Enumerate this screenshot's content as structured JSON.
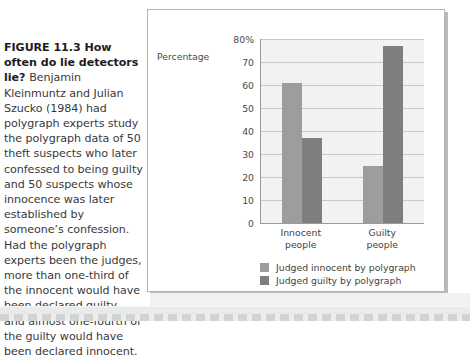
{
  "figure": {
    "caption_lead": "FIGURE 11.3 How often do lie detectors lie? ",
    "caption_body": "Benjamin Kleinmuntz and Julian Szucko (1984) had polygraph experts study the polygraph data of 50 theft suspects who later confessed to being guilty and 50 suspects whose innocence was later established by someone’s confession. Had the polygraph experts been the judges, more than one-third of the innocent would have been declared guilty, and almost one-fourth of the guilty would have been declared innocent."
  },
  "colors": {
    "series_light": "#9d9d9d",
    "series_dark": "#7e7e80",
    "plot_background": "#f2f2f2",
    "gridline": "#c9c9c9",
    "axis": "#9a9a9a",
    "text": "#3f3f41",
    "card_border": "#b2b5b7"
  },
  "chart_data": {
    "type": "bar",
    "title": "",
    "xlabel": "",
    "ylabel": "Percentage",
    "ylim": [
      0,
      80
    ],
    "yticks": [
      "80%",
      "70",
      "60",
      "50",
      "40",
      "30",
      "20",
      "10",
      "0"
    ],
    "ytick_values": [
      80,
      70,
      60,
      50,
      40,
      30,
      20,
      10,
      0
    ],
    "grid": true,
    "legend_position": "below-left",
    "categories": [
      "Innocent\npeople",
      "Guilty\npeople"
    ],
    "category_lines": [
      [
        "Innocent",
        "people"
      ],
      [
        "Guilty",
        "people"
      ]
    ],
    "series": [
      {
        "name": "Judged innocent by polygraph",
        "values": [
          61,
          25
        ],
        "color": "#9d9d9d"
      },
      {
        "name": "Judged guilty by polygraph",
        "values": [
          37,
          77
        ],
        "color": "#7e7e80"
      }
    ]
  }
}
